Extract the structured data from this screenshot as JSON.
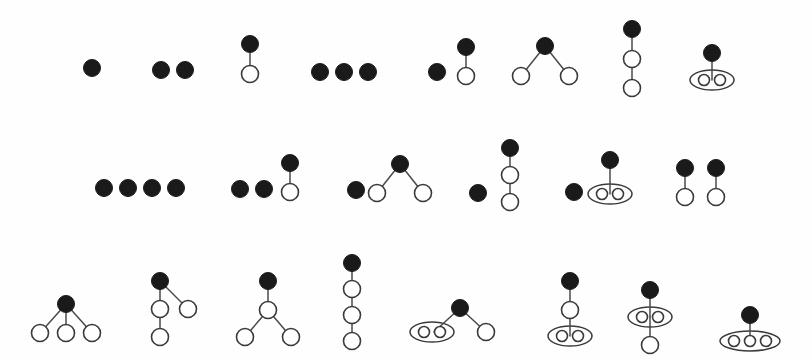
{
  "figure": {
    "background_color": "#fefefe",
    "filled_node_color": "#1a1a1a",
    "open_node_color": "#ffffff",
    "stroke_color": "#3a3a3a",
    "edge_color": "#4a4a4a",
    "rows": 3,
    "items_total": 21,
    "filled_radius": 8.5,
    "open_radius": 8.5,
    "small_open_radius": 5.5
  },
  "diagrams": [
    {
      "id": "d01",
      "row": 1,
      "label": "single-filled-node",
      "nodes": [
        {
          "x": 92,
          "y": 68,
          "type": "filled"
        }
      ],
      "edges": [],
      "ellipses": []
    },
    {
      "id": "d02",
      "row": 1,
      "label": "two-filled-nodes",
      "nodes": [
        {
          "x": 161,
          "y": 70,
          "type": "filled"
        },
        {
          "x": 185,
          "y": 70,
          "type": "filled"
        }
      ],
      "edges": [],
      "ellipses": []
    },
    {
      "id": "d03",
      "row": 1,
      "label": "filled-over-open-edge",
      "nodes": [
        {
          "x": 250,
          "y": 44,
          "type": "filled"
        },
        {
          "x": 250,
          "y": 74,
          "type": "open"
        }
      ],
      "edges": [
        {
          "x1": 250,
          "y1": 44,
          "x2": 250,
          "y2": 74
        }
      ],
      "ellipses": []
    },
    {
      "id": "d04",
      "row": 1,
      "label": "three-filled-nodes",
      "nodes": [
        {
          "x": 320,
          "y": 72,
          "type": "filled"
        },
        {
          "x": 344,
          "y": 72,
          "type": "filled"
        },
        {
          "x": 368,
          "y": 72,
          "type": "filled"
        }
      ],
      "edges": [],
      "ellipses": []
    },
    {
      "id": "d05",
      "row": 1,
      "label": "filled-dot-plus-pair",
      "nodes": [
        {
          "x": 437,
          "y": 72,
          "type": "filled"
        },
        {
          "x": 466,
          "y": 47,
          "type": "filled"
        },
        {
          "x": 466,
          "y": 76,
          "type": "open"
        }
      ],
      "edges": [
        {
          "x1": 466,
          "y1": 47,
          "x2": 466,
          "y2": 76
        }
      ],
      "ellipses": []
    },
    {
      "id": "d06",
      "row": 1,
      "label": "two-leaf-star",
      "nodes": [
        {
          "x": 545,
          "y": 46,
          "type": "filled"
        },
        {
          "x": 521,
          "y": 76,
          "type": "open"
        },
        {
          "x": 569,
          "y": 76,
          "type": "open"
        }
      ],
      "edges": [
        {
          "x1": 545,
          "y1": 46,
          "x2": 521,
          "y2": 76
        },
        {
          "x1": 545,
          "y1": 46,
          "x2": 569,
          "y2": 76
        }
      ],
      "ellipses": []
    },
    {
      "id": "d07",
      "row": 1,
      "label": "three-node-chain",
      "nodes": [
        {
          "x": 632,
          "y": 29,
          "type": "filled"
        },
        {
          "x": 632,
          "y": 59,
          "type": "open"
        },
        {
          "x": 632,
          "y": 88,
          "type": "open"
        }
      ],
      "edges": [
        {
          "x1": 632,
          "y1": 29,
          "x2": 632,
          "y2": 59
        },
        {
          "x1": 632,
          "y1": 59,
          "x2": 632,
          "y2": 88
        }
      ],
      "ellipses": []
    },
    {
      "id": "d08",
      "row": 1,
      "label": "filled-over-ellipse-two",
      "nodes": [
        {
          "x": 712,
          "y": 53,
          "type": "filled"
        },
        {
          "x": 704,
          "y": 80,
          "type": "small-open"
        },
        {
          "x": 720,
          "y": 80,
          "type": "small-open"
        }
      ],
      "edges": [
        {
          "x1": 712,
          "y1": 53,
          "x2": 712,
          "y2": 80
        }
      ],
      "ellipses": [
        {
          "cx": 712,
          "cy": 80,
          "rx": 22,
          "ry": 10
        }
      ]
    },
    {
      "id": "d09",
      "row": 2,
      "label": "four-filled-nodes",
      "nodes": [
        {
          "x": 104,
          "y": 188,
          "type": "filled"
        },
        {
          "x": 128,
          "y": 188,
          "type": "filled"
        },
        {
          "x": 152,
          "y": 188,
          "type": "filled"
        },
        {
          "x": 176,
          "y": 188,
          "type": "filled"
        }
      ],
      "edges": [],
      "ellipses": []
    },
    {
      "id": "d10",
      "row": 2,
      "label": "two-dots-plus-pair",
      "nodes": [
        {
          "x": 240,
          "y": 189,
          "type": "filled"
        },
        {
          "x": 264,
          "y": 189,
          "type": "filled"
        },
        {
          "x": 290,
          "y": 163,
          "type": "filled"
        },
        {
          "x": 290,
          "y": 192,
          "type": "open"
        }
      ],
      "edges": [
        {
          "x1": 290,
          "y1": 163,
          "x2": 290,
          "y2": 192
        }
      ],
      "ellipses": []
    },
    {
      "id": "d11",
      "row": 2,
      "label": "dot-plus-two-leaf-star",
      "nodes": [
        {
          "x": 356,
          "y": 190,
          "type": "filled"
        },
        {
          "x": 400,
          "y": 164,
          "type": "filled"
        },
        {
          "x": 377,
          "y": 193,
          "type": "open"
        },
        {
          "x": 423,
          "y": 193,
          "type": "open"
        }
      ],
      "edges": [
        {
          "x1": 400,
          "y1": 164,
          "x2": 377,
          "y2": 193
        },
        {
          "x1": 400,
          "y1": 164,
          "x2": 423,
          "y2": 193
        }
      ],
      "ellipses": []
    },
    {
      "id": "d12",
      "row": 2,
      "label": "dot-plus-three-chain",
      "nodes": [
        {
          "x": 478,
          "y": 193,
          "type": "filled"
        },
        {
          "x": 510,
          "y": 148,
          "type": "filled"
        },
        {
          "x": 510,
          "y": 175,
          "type": "open"
        },
        {
          "x": 510,
          "y": 202,
          "type": "open"
        }
      ],
      "edges": [
        {
          "x1": 510,
          "y1": 148,
          "x2": 510,
          "y2": 175
        },
        {
          "x1": 510,
          "y1": 175,
          "x2": 510,
          "y2": 202
        }
      ],
      "ellipses": []
    },
    {
      "id": "d13",
      "row": 2,
      "label": "dot-plus-ellipse-two",
      "nodes": [
        {
          "x": 574,
          "y": 192,
          "type": "filled"
        },
        {
          "x": 610,
          "y": 160,
          "type": "filled"
        },
        {
          "x": 602,
          "y": 194,
          "type": "small-open"
        },
        {
          "x": 618,
          "y": 194,
          "type": "small-open"
        }
      ],
      "edges": [
        {
          "x1": 610,
          "y1": 160,
          "x2": 610,
          "y2": 194
        }
      ],
      "ellipses": [
        {
          "cx": 610,
          "cy": 194,
          "rx": 22,
          "ry": 10
        }
      ]
    },
    {
      "id": "d14",
      "row": 2,
      "label": "two-disjoint-pairs",
      "nodes": [
        {
          "x": 685,
          "y": 168,
          "type": "filled"
        },
        {
          "x": 685,
          "y": 197,
          "type": "open"
        },
        {
          "x": 716,
          "y": 168,
          "type": "filled"
        },
        {
          "x": 716,
          "y": 197,
          "type": "open"
        }
      ],
      "edges": [
        {
          "x1": 685,
          "y1": 168,
          "x2": 685,
          "y2": 197
        },
        {
          "x1": 716,
          "y1": 168,
          "x2": 716,
          "y2": 197
        }
      ],
      "ellipses": []
    },
    {
      "id": "d15",
      "row": 3,
      "label": "three-leaf-star",
      "nodes": [
        {
          "x": 66,
          "y": 304,
          "type": "filled"
        },
        {
          "x": 40,
          "y": 333,
          "type": "open"
        },
        {
          "x": 66,
          "y": 333,
          "type": "open"
        },
        {
          "x": 92,
          "y": 333,
          "type": "open"
        }
      ],
      "edges": [
        {
          "x1": 66,
          "y1": 304,
          "x2": 40,
          "y2": 333
        },
        {
          "x1": 66,
          "y1": 304,
          "x2": 66,
          "y2": 333
        },
        {
          "x1": 66,
          "y1": 304,
          "x2": 92,
          "y2": 333
        }
      ],
      "ellipses": []
    },
    {
      "id": "d16",
      "row": 3,
      "label": "branching-tree-left-deep",
      "nodes": [
        {
          "x": 160,
          "y": 281,
          "type": "filled"
        },
        {
          "x": 160,
          "y": 309,
          "type": "open"
        },
        {
          "x": 188,
          "y": 309,
          "type": "open"
        },
        {
          "x": 160,
          "y": 337,
          "type": "open"
        }
      ],
      "edges": [
        {
          "x1": 160,
          "y1": 281,
          "x2": 160,
          "y2": 309
        },
        {
          "x1": 160,
          "y1": 281,
          "x2": 188,
          "y2": 309
        },
        {
          "x1": 160,
          "y1": 309,
          "x2": 160,
          "y2": 337
        }
      ],
      "ellipses": []
    },
    {
      "id": "d17",
      "row": 3,
      "label": "root-middle-two-leaves",
      "nodes": [
        {
          "x": 268,
          "y": 281,
          "type": "filled"
        },
        {
          "x": 268,
          "y": 310,
          "type": "open"
        },
        {
          "x": 245,
          "y": 337,
          "type": "open"
        },
        {
          "x": 291,
          "y": 337,
          "type": "open"
        }
      ],
      "edges": [
        {
          "x1": 268,
          "y1": 281,
          "x2": 268,
          "y2": 310
        },
        {
          "x1": 268,
          "y1": 310,
          "x2": 245,
          "y2": 337
        },
        {
          "x1": 268,
          "y1": 310,
          "x2": 291,
          "y2": 337
        }
      ],
      "ellipses": []
    },
    {
      "id": "d18",
      "row": 3,
      "label": "four-node-chain",
      "nodes": [
        {
          "x": 352,
          "y": 263,
          "type": "filled"
        },
        {
          "x": 352,
          "y": 289,
          "type": "open"
        },
        {
          "x": 352,
          "y": 315,
          "type": "open"
        },
        {
          "x": 352,
          "y": 341,
          "type": "open"
        }
      ],
      "edges": [
        {
          "x1": 352,
          "y1": 263,
          "x2": 352,
          "y2": 289
        },
        {
          "x1": 352,
          "y1": 289,
          "x2": 352,
          "y2": 315
        },
        {
          "x1": 352,
          "y1": 315,
          "x2": 352,
          "y2": 341
        }
      ],
      "ellipses": []
    },
    {
      "id": "d19",
      "row": 3,
      "label": "ellipse-two-and-leaf",
      "nodes": [
        {
          "x": 460,
          "y": 308,
          "type": "filled"
        },
        {
          "x": 424,
          "y": 332,
          "type": "small-open"
        },
        {
          "x": 440,
          "y": 332,
          "type": "small-open"
        },
        {
          "x": 486,
          "y": 332,
          "type": "open"
        }
      ],
      "edges": [
        {
          "x1": 460,
          "y1": 308,
          "x2": 434,
          "y2": 332
        },
        {
          "x1": 460,
          "y1": 308,
          "x2": 486,
          "y2": 332
        }
      ],
      "ellipses": [
        {
          "cx": 432,
          "cy": 332,
          "rx": 22,
          "ry": 10
        }
      ]
    },
    {
      "id": "d20",
      "row": 3,
      "label": "chain-into-ellipse-two",
      "nodes": [
        {
          "x": 570,
          "y": 281,
          "type": "filled"
        },
        {
          "x": 570,
          "y": 310,
          "type": "open"
        },
        {
          "x": 562,
          "y": 336,
          "type": "small-open"
        },
        {
          "x": 578,
          "y": 336,
          "type": "small-open"
        }
      ],
      "edges": [
        {
          "x1": 570,
          "y1": 281,
          "x2": 570,
          "y2": 310
        },
        {
          "x1": 570,
          "y1": 310,
          "x2": 570,
          "y2": 336
        }
      ],
      "ellipses": [
        {
          "cx": 570,
          "cy": 336,
          "rx": 22,
          "ry": 10
        }
      ]
    },
    {
      "id": "d21",
      "row": 3,
      "label": "ellipse-two-with-below-leaf",
      "nodes": [
        {
          "x": 650,
          "y": 290,
          "type": "filled"
        },
        {
          "x": 642,
          "y": 317,
          "type": "small-open"
        },
        {
          "x": 658,
          "y": 317,
          "type": "small-open"
        },
        {
          "x": 650,
          "y": 345,
          "type": "open"
        }
      ],
      "edges": [
        {
          "x1": 650,
          "y1": 290,
          "x2": 650,
          "y2": 317
        },
        {
          "x1": 650,
          "y1": 317,
          "x2": 650,
          "y2": 345
        }
      ],
      "ellipses": [
        {
          "cx": 650,
          "cy": 317,
          "rx": 22,
          "ry": 10
        }
      ]
    },
    {
      "id": "d22",
      "row": 3,
      "label": "filled-over-ellipse-three",
      "nodes": [
        {
          "x": 750,
          "y": 315,
          "type": "filled"
        },
        {
          "x": 734,
          "y": 341,
          "type": "small-open"
        },
        {
          "x": 750,
          "y": 341,
          "type": "small-open"
        },
        {
          "x": 766,
          "y": 341,
          "type": "small-open"
        }
      ],
      "edges": [
        {
          "x1": 750,
          "y1": 315,
          "x2": 750,
          "y2": 341
        }
      ],
      "ellipses": [
        {
          "cx": 750,
          "cy": 341,
          "rx": 30,
          "ry": 10
        }
      ]
    }
  ]
}
